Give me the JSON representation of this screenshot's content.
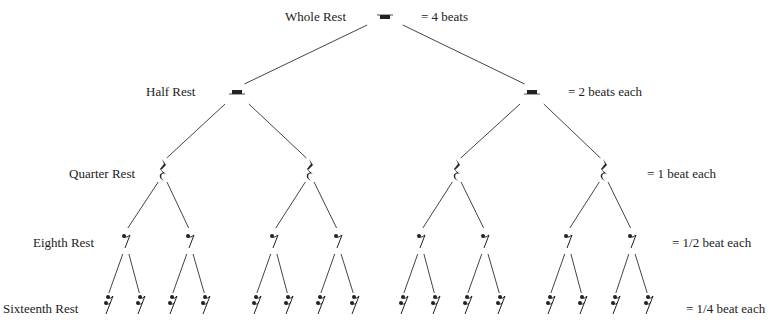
{
  "levels": [
    {
      "label": "Whole Rest",
      "value": "= 4 beats",
      "count": 1
    },
    {
      "label": "Half Rest",
      "value": "= 2 beats each",
      "count": 2
    },
    {
      "label": "Quarter Rest",
      "value": "= 1 beat each",
      "count": 4
    },
    {
      "label": "Eighth Rest",
      "value": "= 1/2 beat each",
      "count": 8
    },
    {
      "label": "Sixteenth Rest",
      "value": "= 1/4 beat each",
      "count": 16
    }
  ],
  "symbols": [
    "whole-rest-icon",
    "half-rest-icon",
    "quarter-rest-icon",
    "eighth-rest-icon",
    "sixteenth-rest-icon"
  ],
  "colors": {
    "ink": "#222222",
    "line": "#444444",
    "background": "#ffffff"
  }
}
